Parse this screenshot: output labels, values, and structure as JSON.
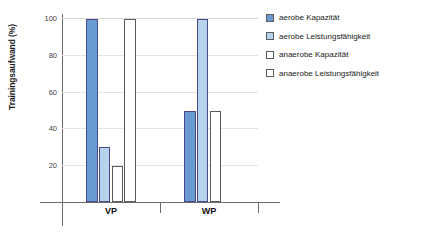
{
  "chart_data": {
    "type": "bar",
    "title": "",
    "xlabel": "",
    "ylabel": "Trainingsaufwand (%)",
    "categories": [
      "VP",
      "WP"
    ],
    "ylim": [
      0,
      103
    ],
    "yticks": [
      20,
      40,
      60,
      80,
      100
    ],
    "ytick_labels": [
      "20",
      "40",
      "60",
      "80",
      "100"
    ],
    "grid": true,
    "legend_position": "right",
    "series": [
      {
        "name": "aerobe Kapazität",
        "values": [
          100,
          50
        ],
        "color": "#6a9ad2",
        "edge": "#4a4a8a"
      },
      {
        "name": "aerobe Leistungsfähigkeit",
        "values": [
          30,
          100
        ],
        "color": "#b6d3ec",
        "edge": "#4a4a8a"
      },
      {
        "name": "anaerobe Kapazität",
        "values": [
          20,
          50
        ],
        "color": "#ffffff",
        "edge": "#5a5a5a"
      },
      {
        "name": "anaerobe Leistungsfähigkeit",
        "values": [
          100,
          0
        ],
        "color": "#ffffff",
        "edge": "#5a5a5a"
      }
    ]
  },
  "axis": {
    "y_title": "Trainingsaufwand (%)",
    "ytick_0": "20",
    "ytick_1": "40",
    "ytick_2": "60",
    "ytick_3": "80",
    "ytick_4": "100",
    "xtick_0": "VP",
    "xtick_1": "WP"
  },
  "legend": {
    "items": [
      {
        "label": "aerobe Kapazität",
        "color": "#6a9ad2"
      },
      {
        "label": "aerobe Leistungsfähigkeit",
        "color": "#b6d3ec"
      },
      {
        "label": "anaerobe Kapazität",
        "color": "#ffffff"
      },
      {
        "label": "anaerobe Leistungsfähigkeit",
        "color": "#ffffff"
      }
    ]
  }
}
